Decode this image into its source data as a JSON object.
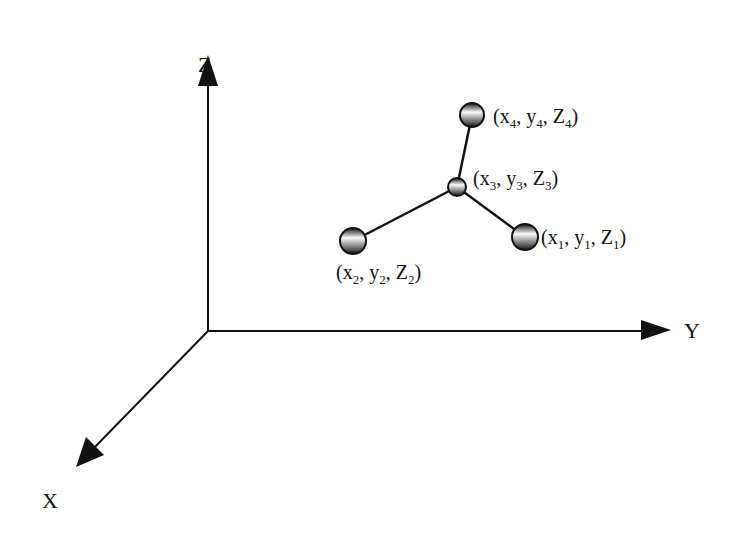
{
  "diagram": {
    "type": "3d-coordinate-molecule",
    "axes": {
      "z": {
        "label": "Z"
      },
      "y": {
        "label": "Y"
      },
      "x": {
        "label": "X"
      }
    },
    "atoms": [
      {
        "id": "atom-1",
        "label_x": "x",
        "label_y": "y",
        "label_z": "z",
        "sub": "1"
      },
      {
        "id": "atom-2",
        "label_x": "x",
        "label_y": "y",
        "label_z": "z",
        "sub": "2"
      },
      {
        "id": "atom-3",
        "label_x": "x",
        "label_y": "y",
        "label_z": "z",
        "sub": "3"
      },
      {
        "id": "atom-4",
        "label_x": "x",
        "label_y": "y",
        "label_z": "z",
        "sub": "4"
      }
    ],
    "bonds": [
      {
        "from": "atom-3",
        "to": "atom-4"
      },
      {
        "from": "atom-3",
        "to": "atom-2"
      },
      {
        "from": "atom-3",
        "to": "atom-1"
      }
    ],
    "colors": {
      "line": "#111111",
      "sphere_light": "#ffffff",
      "sphere_dark": "#1a1a1a"
    }
  }
}
